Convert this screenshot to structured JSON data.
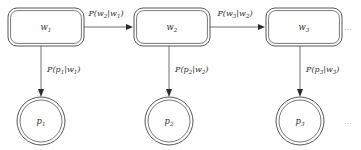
{
  "diagram": {
    "background_color": "#ffffff",
    "line_color": "#595959",
    "text_color": "#303030",
    "ellipsis": "…",
    "states": [
      {
        "id": "w1",
        "base": "w",
        "subscript": "1",
        "shape": "rounded-rectangle-double",
        "x": 8,
        "y": 8,
        "width": 76,
        "height": 38
      },
      {
        "id": "w2",
        "base": "w",
        "subscript": "2",
        "shape": "rounded-rectangle-double",
        "x": 134,
        "y": 8,
        "width": 76,
        "height": 38
      },
      {
        "id": "w3",
        "base": "w",
        "subscript": "3",
        "shape": "rounded-rectangle-double",
        "x": 266,
        "y": 8,
        "width": 76,
        "height": 38
      }
    ],
    "observations": [
      {
        "id": "p1",
        "base": "p",
        "subscript": "1",
        "shape": "circle-double",
        "cx": 41,
        "cy": 121,
        "r_outer": 24,
        "r_inner": 21
      },
      {
        "id": "p2",
        "base": "p",
        "subscript": "2",
        "shape": "circle-double",
        "cx": 169,
        "cy": 121,
        "r_outer": 24,
        "r_inner": 21
      },
      {
        "id": "p3",
        "base": "p",
        "subscript": "3",
        "shape": "circle-double",
        "cx": 300,
        "cy": 121,
        "r_outer": 24,
        "r_inner": 21
      }
    ],
    "transitions": [
      {
        "id": "w1-to-w2",
        "from": "w1",
        "to": "w2",
        "label_function": "P",
        "label_numerator": "w",
        "label_numerator_sub": "2",
        "label_denominator": "w",
        "label_denominator_sub": "1",
        "label_text": "P(w2|w1)"
      },
      {
        "id": "w2-to-w3",
        "from": "w2",
        "to": "w3",
        "label_function": "P",
        "label_numerator": "w",
        "label_numerator_sub": "3",
        "label_denominator": "w",
        "label_denominator_sub": "2",
        "label_text": "P(w3|w2)"
      }
    ],
    "emissions": [
      {
        "id": "w1-to-p1",
        "from": "w1",
        "to": "p1",
        "label_function": "P",
        "label_numerator": "p",
        "label_numerator_sub": "1",
        "label_denominator": "w",
        "label_denominator_sub": "1",
        "label_text": "P(p1|w1)"
      },
      {
        "id": "w2-to-p2",
        "from": "w2",
        "to": "p2",
        "label_function": "P",
        "label_numerator": "p",
        "label_numerator_sub": "2",
        "label_denominator": "w",
        "label_denominator_sub": "2",
        "label_text": "P(p2|w2)"
      },
      {
        "id": "w3-to-p3",
        "from": "w3",
        "to": "p3",
        "label_function": "P",
        "label_numerator": "p",
        "label_numerator_sub": "3",
        "label_denominator": "w",
        "label_denominator_sub": "3",
        "label_text": "P(p3|w3)"
      }
    ],
    "continuations": [
      {
        "id": "states-continuation",
        "text": "…",
        "x": 348,
        "y": 30
      },
      {
        "id": "observations-continuation",
        "text": "…",
        "x": 348,
        "y": 124
      }
    ]
  }
}
